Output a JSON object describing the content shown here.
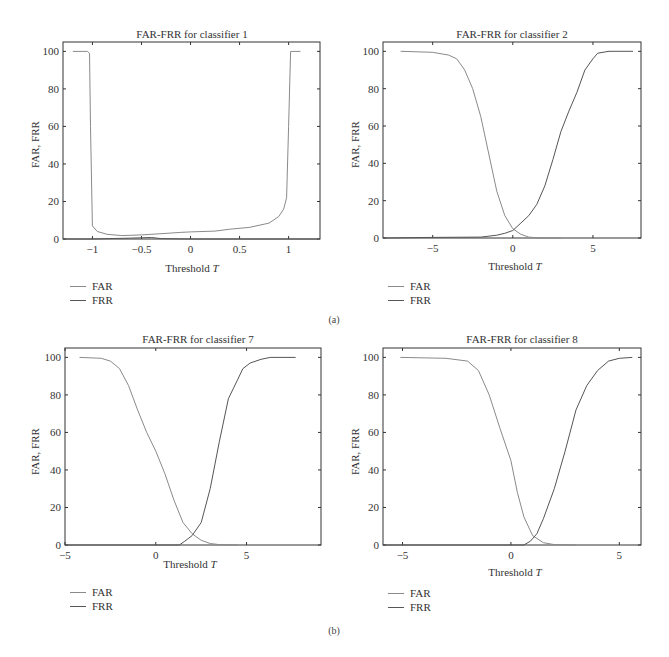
{
  "figure_labels": {
    "a": "(a)",
    "b": "(b)"
  },
  "legend": {
    "far": "FAR",
    "frr": "FRR"
  },
  "axis": {
    "ylabel": "FAR, FRR",
    "xlabel_prefix": "Threshold ",
    "xlabel_var": "T"
  },
  "colors": {
    "frame": "#333333",
    "far": "#8a8a8a",
    "frr": "#555555"
  },
  "chart_data": [
    {
      "type": "line",
      "title": "FAR-FRR for classifier 1",
      "xlabel": "Threshold T",
      "ylabel": "FAR, FRR",
      "xlim": [
        -1.3,
        1.32
      ],
      "ylim": [
        0,
        105
      ],
      "xticks": [
        -1,
        -0.5,
        0,
        0.5,
        1
      ],
      "xtick_labels": [
        "−1",
        "−0.5",
        "0",
        "0.5",
        "1"
      ],
      "yticks": [
        0,
        20,
        40,
        60,
        80,
        100
      ],
      "legend": [
        "FAR",
        "FRR"
      ],
      "series": [
        {
          "name": "FAR",
          "x": [
            -1.2,
            -1.05,
            -1.03,
            -1.02,
            -1.0,
            -0.95,
            -0.85,
            -0.7,
            -0.5,
            -0.3,
            -0.1,
            0.0,
            0.25,
            0.4,
            0.6,
            0.8,
            0.9,
            0.95,
            0.98,
            1.0,
            1.02,
            1.12
          ],
          "y": [
            100,
            100,
            99,
            60,
            7,
            4,
            2.5,
            1.8,
            2.2,
            2.8,
            3.5,
            3.8,
            4.2,
            5.2,
            6.2,
            8.5,
            12,
            16,
            22,
            60,
            100,
            100
          ]
        },
        {
          "name": "FRR",
          "x": [
            -1.3,
            -1.0,
            -0.6,
            -0.4,
            -0.3,
            0.0,
            0.5,
            0.98,
            1.0,
            1.3
          ],
          "y": [
            0,
            0,
            0.5,
            0.8,
            0.2,
            0,
            0,
            0,
            0,
            0
          ]
        }
      ]
    },
    {
      "type": "line",
      "title": "FAR-FRR for classifier 2",
      "xlabel": "Threshold T",
      "ylabel": "FAR, FRR",
      "xlim": [
        -8.1,
        8.0
      ],
      "ylim": [
        0,
        105
      ],
      "xticks": [
        -5,
        0,
        5
      ],
      "xtick_labels": [
        "−5",
        "0",
        "5"
      ],
      "yticks": [
        0,
        20,
        40,
        60,
        80,
        100
      ],
      "legend": [
        "FAR",
        "FRR"
      ],
      "series": [
        {
          "name": "FAR",
          "x": [
            -7,
            -5,
            -4,
            -3.5,
            -3,
            -2.5,
            -2,
            -1.5,
            -1,
            -0.5,
            0,
            0.5,
            1,
            1.5,
            2,
            3
          ],
          "y": [
            100,
            99.5,
            98,
            96,
            90,
            80,
            65,
            45,
            25,
            12,
            5,
            2,
            0.5,
            0.1,
            0,
            0
          ]
        },
        {
          "name": "FRR",
          "x": [
            -8,
            -5,
            -2,
            -1,
            -0.5,
            0,
            0.5,
            1,
            1.5,
            2,
            2.5,
            3,
            3.5,
            4,
            4.5,
            5,
            5.3,
            6,
            7.5
          ],
          "y": [
            0,
            0.3,
            0.5,
            1.5,
            2.5,
            4,
            8,
            12,
            18,
            28,
            42,
            57,
            68,
            78,
            90,
            96,
            99,
            100,
            100
          ]
        }
      ]
    },
    {
      "type": "line",
      "title": "FAR-FRR for classifier 7",
      "xlabel": "Threshold T",
      "ylabel": "FAR, FRR",
      "xlim": [
        -5,
        9.1
      ],
      "ylim": [
        0,
        105
      ],
      "xticks": [
        -5,
        0,
        5
      ],
      "xtick_labels": [
        "−5",
        "0",
        "5"
      ],
      "yticks": [
        0,
        20,
        40,
        60,
        80,
        100
      ],
      "legend": [
        "FAR",
        "FRR"
      ],
      "series": [
        {
          "name": "FAR",
          "x": [
            -4.2,
            -3,
            -2.5,
            -2,
            -1.5,
            -1,
            -0.5,
            0,
            0.5,
            1,
            1.5,
            2,
            2.5,
            3,
            3.5,
            4.5
          ],
          "y": [
            100,
            99.5,
            98,
            94,
            85,
            72,
            60,
            50,
            38,
            24,
            12,
            6,
            2.5,
            0.8,
            0.2,
            0
          ]
        },
        {
          "name": "FRR",
          "x": [
            -5,
            1.3,
            1.6,
            2,
            2.5,
            3,
            3.5,
            4,
            4.5,
            4.8,
            5.2,
            5.8,
            6.3,
            7.7
          ],
          "y": [
            0,
            0,
            2,
            5,
            12,
            30,
            55,
            78,
            88,
            94,
            97,
            99,
            100,
            100
          ]
        }
      ]
    },
    {
      "type": "line",
      "title": "FAR-FRR for classifier 8",
      "xlabel": "Threshold T",
      "ylabel": "FAR, FRR",
      "xlim": [
        -5.9,
        6.0
      ],
      "ylim": [
        0,
        105
      ],
      "xticks": [
        -5,
        0,
        5
      ],
      "xtick_labels": [
        "−5",
        "0",
        "5"
      ],
      "yticks": [
        0,
        20,
        40,
        60,
        80,
        100
      ],
      "legend": [
        "FAR",
        "FRR"
      ],
      "series": [
        {
          "name": "FAR",
          "x": [
            -5.1,
            -3,
            -2,
            -1.5,
            -1,
            -0.5,
            0,
            0.3,
            0.6,
            1,
            1.5,
            2,
            3
          ],
          "y": [
            100,
            99.5,
            98,
            93,
            80,
            62,
            45,
            28,
            15,
            5,
            1.2,
            0.2,
            0
          ]
        },
        {
          "name": "FRR",
          "x": [
            -5.9,
            0.6,
            0.9,
            1.2,
            1.5,
            2,
            2.5,
            3,
            3.5,
            4,
            4.5,
            5,
            5.6
          ],
          "y": [
            0,
            0,
            2,
            6,
            14,
            30,
            50,
            72,
            85,
            93,
            98,
            99.5,
            100
          ]
        }
      ]
    }
  ]
}
